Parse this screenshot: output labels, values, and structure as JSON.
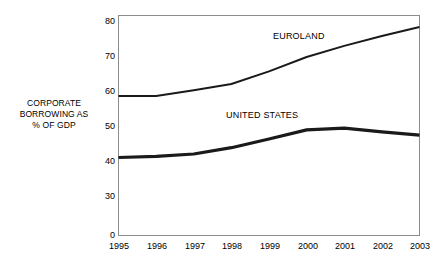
{
  "chart_data": {
    "type": "line",
    "title": "",
    "subtitle": "",
    "xlabel": "",
    "ylabel": "CORPORATE BORROWING AS % OF GDP",
    "ylabel_lines": [
      "CORPORATE",
      "BORROWING AS",
      "% OF GDP"
    ],
    "categories": [
      "1995",
      "1996",
      "1997",
      "1998",
      "1999",
      "2000",
      "2001",
      "2002",
      "2003"
    ],
    "x": [
      1995,
      1996,
      1997,
      1998,
      1999,
      2000,
      2001,
      2002,
      2003
    ],
    "yticks": [
      0,
      30,
      40,
      50,
      60,
      70,
      80
    ],
    "ytick_labels": [
      "0",
      "30",
      "40",
      "50",
      "60",
      "70",
      "80"
    ],
    "ylim": [
      30,
      83
    ],
    "axis_break": true,
    "grid": false,
    "legend": "inline-annotations",
    "series": [
      {
        "name": "EUROLAND",
        "label": "EUROLAND",
        "values": [
          58.6,
          58.6,
          60.2,
          62.0,
          65.6,
          69.7,
          72.9,
          75.7,
          78.3
        ],
        "color": "#1a1a1a",
        "width": 2.0
      },
      {
        "name": "UNITED STATES",
        "label": "UNITED STATES",
        "values": [
          41.0,
          41.3,
          42.0,
          43.8,
          46.3,
          48.9,
          49.4,
          48.3,
          47.4
        ],
        "color": "#1a1a1a",
        "width": 3.2
      }
    ],
    "annotations": [
      {
        "text": "EUROLAND",
        "x": 2000,
        "y": 76.5
      },
      {
        "text": "UNITED STATES",
        "x": 1999.3,
        "y": 52.5
      }
    ]
  },
  "colors": {
    "axis": "#7a7a7a",
    "line": "#1a1a1a",
    "text": "#000000",
    "background": "#ffffff"
  }
}
